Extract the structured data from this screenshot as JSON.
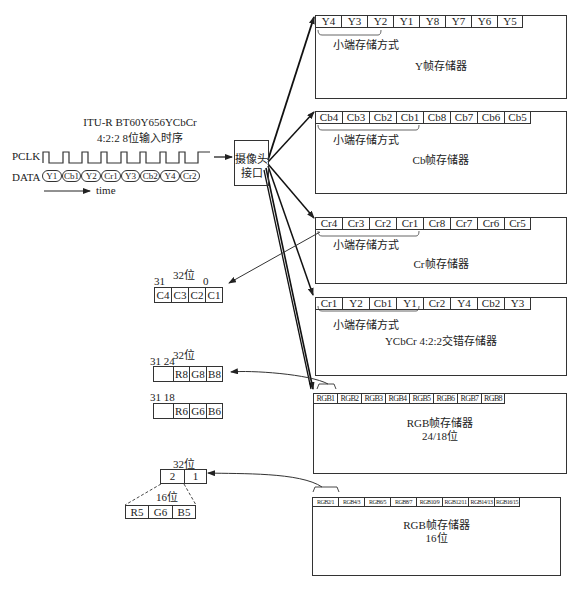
{
  "timing": {
    "title_line1": "ITU-R BT60Y656YCbCr",
    "title_line2": "4:2:2 8位输入时序",
    "pclk_label": "PCLK",
    "data_label": "DATA",
    "data_samples": [
      "Y1",
      "Cb1",
      "Y2",
      "Cr1",
      "Y3",
      "Cb2",
      "Y4",
      "Cr2"
    ],
    "time_label": "time"
  },
  "camera_interface": {
    "line1": "摄像头",
    "line2": "接口"
  },
  "memories": [
    {
      "id": "y",
      "cells": [
        "Y4",
        "Y3",
        "Y2",
        "Y1",
        "Y8",
        "Y7",
        "Y6",
        "Y5"
      ],
      "endian_label": "小端存储方式",
      "title": "Y帧存储器"
    },
    {
      "id": "cb",
      "cells": [
        "Cb4",
        "Cb3",
        "Cb2",
        "Cb1",
        "Cb8",
        "Cb7",
        "Cb6",
        "Cb5"
      ],
      "endian_label": "小端存储方式",
      "title": "Cb帧存储器"
    },
    {
      "id": "cr",
      "cells": [
        "Cr4",
        "Cr3",
        "Cr2",
        "Cr1",
        "Cr8",
        "Cr7",
        "Cr6",
        "Cr5"
      ],
      "endian_label": "小端存储方式",
      "title": "Cr帧存储器"
    },
    {
      "id": "ycbcr",
      "cells": [
        "Cr1",
        "Y2",
        "Cb1",
        "Y1",
        "Cr2",
        "Y4",
        "Cb2",
        "Y3"
      ],
      "endian_label": "小端存储方式",
      "title": "YCbCr 4:2:2交错存储器"
    },
    {
      "id": "rgb24",
      "cells": [
        "RGB1",
        "RGB2",
        "RGB3",
        "RGB4",
        "RGB5",
        "RGB6",
        "RGB7",
        "RGB8"
      ],
      "title": "RGB帧存储器",
      "subtitle": "24/18位"
    },
    {
      "id": "rgb16",
      "cells": [
        "RGB2/1",
        "RGB4/3",
        "RGB6/5",
        "RGB8/7",
        "RGB10/9",
        "RGB12/11",
        "RGB14/13",
        "RGB16/15"
      ],
      "title": "RGB帧存储器",
      "subtitle": "16位"
    }
  ],
  "registers": {
    "c32": {
      "width_label": "32位",
      "msb": "31",
      "lsb": "0",
      "cells": [
        "C4",
        "C3",
        "C2",
        "C1"
      ]
    },
    "rgb24": {
      "width_label": "32位",
      "bit_labels": "31 24",
      "cells": [
        "",
        "R8",
        "G8",
        "B8"
      ]
    },
    "rgb18": {
      "bit_labels": "31 18",
      "cells": [
        "",
        "R6",
        "G6",
        "B6"
      ]
    },
    "rgb16": {
      "width_label": "32位",
      "cells": [
        "2",
        "1"
      ],
      "sub_width_label": "16位",
      "sub_cells": [
        "R5",
        "G6",
        "B5"
      ]
    }
  }
}
